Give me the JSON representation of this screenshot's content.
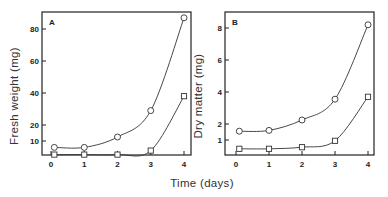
{
  "figure": {
    "x_axis_title": "Time (days)",
    "colors": {
      "line": "#333333",
      "marker_fill": "#ffffff",
      "frame": "#222222"
    }
  },
  "chart_data": [
    {
      "type": "line",
      "panel": "A",
      "title": "",
      "xlabel": "Time (days)",
      "ylabel": "Fresh weight (mg)",
      "x_ticks": [
        0,
        1,
        2,
        3,
        4
      ],
      "y_ticks": [
        10,
        20,
        40,
        60,
        80
      ],
      "xlim": [
        0,
        4.2
      ],
      "ylim": [
        0,
        90
      ],
      "grid": false,
      "legend": null,
      "series": [
        {
          "name": "circles",
          "marker": "circle",
          "x": [
            0.1,
            1,
            2,
            3,
            4
          ],
          "values": [
            6,
            6,
            12.5,
            29,
            87
          ]
        },
        {
          "name": "squares",
          "marker": "square",
          "x": [
            0.1,
            1,
            2,
            3,
            4
          ],
          "values": [
            1.5,
            1.5,
            1.5,
            4,
            38
          ]
        }
      ]
    },
    {
      "type": "line",
      "panel": "B",
      "title": "",
      "xlabel": "Time (days)",
      "ylabel": "Dry matter (mg)",
      "x_ticks": [
        0,
        1,
        2,
        3,
        4
      ],
      "y_ticks": [
        1,
        2,
        4,
        6,
        8
      ],
      "xlim": [
        0,
        4.2
      ],
      "ylim": [
        0,
        9
      ],
      "grid": false,
      "legend": null,
      "series": [
        {
          "name": "circles",
          "marker": "circle",
          "x": [
            0.1,
            1,
            2,
            3,
            4
          ],
          "values": [
            1.55,
            1.6,
            2.25,
            3.55,
            8.2
          ]
        },
        {
          "name": "squares",
          "marker": "square",
          "x": [
            0.1,
            1,
            2,
            3,
            4
          ],
          "values": [
            0.45,
            0.45,
            0.55,
            0.95,
            3.7
          ]
        }
      ]
    }
  ]
}
